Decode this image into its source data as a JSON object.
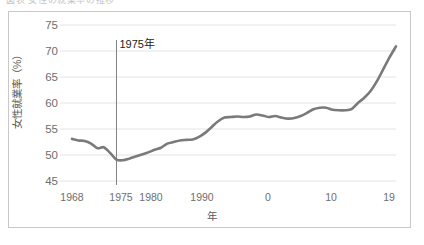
{
  "top_cut_text": {
    "ghost_line": "図表    女性の就業率の推移"
  },
  "chart_data": {
    "type": "line",
    "title": "",
    "xlabel": "年",
    "ylabel": "女性就業率（%）",
    "ylim": [
      45,
      75
    ],
    "yticks": [
      45,
      50,
      55,
      60,
      65,
      70,
      75
    ],
    "xlim": [
      1968,
      2019
    ],
    "xticks": [
      1968,
      1975,
      1980,
      1990,
      2000,
      2010,
      2019
    ],
    "xtick_labels": [
      "1968",
      "1975",
      "1980",
      "1990",
      "0",
      "10",
      "19"
    ],
    "grid": true,
    "legend": "none",
    "line_color": "#7a7a7a",
    "annotations": [
      {
        "label": "1975年",
        "x": 1975,
        "type": "vertical-line-with-label"
      }
    ],
    "series": [
      {
        "name": "女性就業率",
        "x": [
          1968,
          1969,
          1970,
          1971,
          1972,
          1973,
          1974,
          1975,
          1976,
          1977,
          1978,
          1979,
          1980,
          1981,
          1982,
          1983,
          1984,
          1985,
          1986,
          1987,
          1988,
          1989,
          1990,
          1991,
          1992,
          1993,
          1994,
          1995,
          1996,
          1997,
          1998,
          1999,
          2000,
          2001,
          2002,
          2003,
          2004,
          2005,
          2006,
          2007,
          2008,
          2009,
          2010,
          2011,
          2012,
          2013,
          2014,
          2015,
          2016,
          2017,
          2018,
          2019
        ],
        "values": [
          53.1,
          52.8,
          52.7,
          52.2,
          51.3,
          51.5,
          50.4,
          49.1,
          49.0,
          49.3,
          49.7,
          50.1,
          50.5,
          51.0,
          51.4,
          52.2,
          52.5,
          52.8,
          52.9,
          53.0,
          53.5,
          54.3,
          55.4,
          56.5,
          57.2,
          57.3,
          57.4,
          57.3,
          57.4,
          57.8,
          57.6,
          57.3,
          57.5,
          57.2,
          57.0,
          57.1,
          57.5,
          58.1,
          58.8,
          59.1,
          59.1,
          58.7,
          58.6,
          58.6,
          58.8,
          60.0,
          61.0,
          62.3,
          64.2,
          66.5,
          68.8,
          70.9
        ]
      }
    ]
  }
}
